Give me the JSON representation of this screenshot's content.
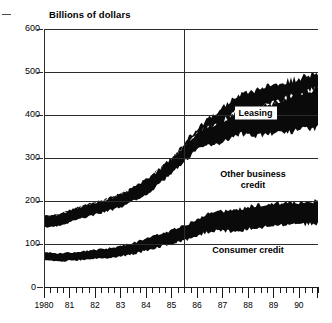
{
  "chart_data": {
    "type": "area",
    "title": "Billions of dollars",
    "xlabel": "",
    "ylabel": "Billions of dollars",
    "ylim": [
      0,
      600
    ],
    "xlim": [
      1980,
      1990.75
    ],
    "y_ticks": [
      0,
      100,
      200,
      300,
      400,
      500,
      600
    ],
    "y_tick_labels": [
      "0",
      "100",
      "200",
      "300",
      "400",
      "500",
      "600"
    ],
    "x_tick_labels": [
      "1980",
      "81",
      "82",
      "83",
      "84",
      "85",
      "86",
      "87",
      "88",
      "89",
      "90"
    ],
    "x_tick_values": [
      1980,
      1981,
      1982,
      1983,
      1984,
      1985,
      1986,
      1987,
      1988,
      1989,
      1990
    ],
    "x_minor_tick_interval": 0.25,
    "grid": "horizontal",
    "legend_position": "inline-annotations",
    "stacked": true,
    "reference_lines": [
      1980,
      1985.5
    ],
    "series": [
      {
        "name": "Consumer credit",
        "label": "Consumer credit",
        "label_style": "plain",
        "x": [
          1980,
          1980.25,
          1980.5,
          1980.75,
          1981,
          1981.25,
          1981.5,
          1981.75,
          1982,
          1982.25,
          1982.5,
          1982.75,
          1983,
          1983.25,
          1983.5,
          1983.75,
          1984,
          1984.25,
          1984.5,
          1984.75,
          1985,
          1985.25,
          1985.5,
          1985.75,
          1986,
          1986.25,
          1986.5,
          1986.75,
          1987,
          1987.25,
          1987.5,
          1987.75,
          1988,
          1988.25,
          1988.5,
          1988.75,
          1989,
          1989.25,
          1989.5,
          1989.75,
          1990,
          1990.25,
          1990.5,
          1990.75
        ],
        "lower": [
          61,
          61,
          60,
          60,
          61,
          62,
          63,
          64,
          65,
          66,
          68,
          70,
          72,
          74,
          77,
          80,
          84,
          88,
          92,
          96,
          100,
          104,
          108,
          112,
          118,
          124,
          128,
          130,
          130,
          130,
          131,
          132,
          134,
          136,
          138,
          140,
          141,
          142,
          143,
          144,
          144,
          145,
          145,
          145
        ],
        "upper": [
          80,
          80,
          79,
          79,
          80,
          81,
          83,
          84,
          86,
          88,
          90,
          93,
          96,
          99,
          103,
          107,
          112,
          117,
          122,
          127,
          132,
          138,
          144,
          150,
          158,
          166,
          172,
          175,
          176,
          177,
          179,
          182,
          186,
          190,
          192,
          193,
          194,
          195,
          196,
          197,
          198,
          199,
          200,
          200
        ],
        "color": "#0a0a0a"
      },
      {
        "name": "Other business credit",
        "label": "Other business credit",
        "label_line1": "Other business",
        "label_line2": "credit",
        "label_style": "plain",
        "x": [
          1980,
          1980.25,
          1980.5,
          1980.75,
          1981,
          1981.25,
          1981.5,
          1981.75,
          1982,
          1982.25,
          1982.5,
          1982.75,
          1983,
          1983.25,
          1983.5,
          1983.75,
          1984,
          1984.25,
          1984.5,
          1984.75,
          1985,
          1985.25,
          1985.5,
          1985.75,
          1986,
          1986.25,
          1986.5,
          1986.75,
          1987,
          1987.25,
          1987.5,
          1987.75,
          1988,
          1988.25,
          1988.5,
          1988.75,
          1989,
          1989.25,
          1989.5,
          1989.75,
          1990,
          1990.25,
          1990.5,
          1990.75
        ],
        "lower": [
          139,
          140,
          142,
          145,
          150,
          155,
          160,
          164,
          168,
          172,
          176,
          180,
          185,
          192,
          200,
          208,
          216,
          226,
          238,
          250,
          262,
          276,
          292,
          306,
          318,
          326,
          330,
          332,
          336,
          344,
          352,
          356,
          352,
          350,
          352,
          356,
          358,
          358,
          360,
          362,
          364,
          366,
          368,
          370
        ],
        "upper": [
          165,
          166,
          168,
          172,
          178,
          183,
          188,
          192,
          196,
          200,
          205,
          210,
          216,
          223,
          231,
          240,
          249,
          260,
          272,
          285,
          298,
          312,
          328,
          343,
          356,
          366,
          372,
          378,
          386,
          396,
          406,
          412,
          412,
          414,
          418,
          424,
          428,
          432,
          438,
          444,
          450,
          455,
          458,
          460
        ],
        "color": "#0a0a0a"
      },
      {
        "name": "Leasing",
        "label": "Leasing",
        "label_style": "boxed",
        "x": [
          1980,
          1980.25,
          1980.5,
          1980.75,
          1981,
          1981.25,
          1981.5,
          1981.75,
          1982,
          1982.25,
          1982.5,
          1982.75,
          1983,
          1983.25,
          1983.5,
          1983.75,
          1984,
          1984.25,
          1984.5,
          1984.75,
          1985,
          1985.25,
          1985.5,
          1985.75,
          1986,
          1986.25,
          1986.5,
          1986.75,
          1987,
          1987.25,
          1987.5,
          1987.75,
          1988,
          1988.25,
          1988.5,
          1988.75,
          1989,
          1989.25,
          1989.5,
          1989.75,
          1990,
          1990.25,
          1990.5,
          1990.75
        ],
        "lower": [
          165,
          166,
          168,
          172,
          178,
          183,
          188,
          192,
          196,
          200,
          205,
          210,
          216,
          223,
          231,
          240,
          249,
          260,
          272,
          285,
          298,
          312,
          328,
          343,
          356,
          366,
          372,
          378,
          386,
          396,
          406,
          412,
          412,
          414,
          418,
          424,
          428,
          432,
          438,
          444,
          450,
          455,
          458,
          460
        ],
        "upper": [
          165,
          166,
          168,
          172,
          178,
          183,
          188,
          192,
          196,
          200,
          205,
          210,
          216,
          223,
          231,
          240,
          249,
          260,
          272,
          285,
          300,
          316,
          334,
          352,
          368,
          382,
          394,
          406,
          418,
          430,
          440,
          448,
          452,
          456,
          460,
          466,
          470,
          474,
          478,
          482,
          486,
          490,
          492,
          494
        ],
        "color": "#0a0a0a"
      }
    ],
    "annotations": [
      {
        "text": "Leasing",
        "style": "boxed",
        "x": 1988.3,
        "y": 405
      },
      {
        "text": "Other business credit",
        "style": "two-line",
        "x": 1988.2,
        "y": 250
      },
      {
        "text": "Consumer credit",
        "style": "plain",
        "x": 1988.0,
        "y": 85
      }
    ]
  },
  "labels": {
    "title": "Billions of dollars",
    "leasing": "Leasing",
    "other_business_line1": "Other business",
    "other_business_line2": "credit",
    "consumer_credit": "Consumer credit",
    "zero": "0"
  },
  "colors": {
    "fill": "#0a0a0a",
    "axis": "#2b2b2b",
    "background": "#ffffff",
    "text": "#000000"
  }
}
